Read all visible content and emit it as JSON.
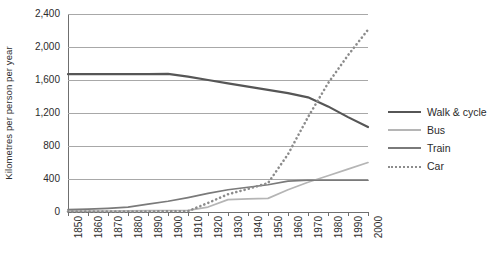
{
  "chart_data": {
    "type": "line",
    "title": "",
    "xlabel": "",
    "ylabel": "Kilometres  per person per year",
    "x": [
      1850,
      1860,
      1870,
      1880,
      1890,
      1900,
      1910,
      1920,
      1930,
      1940,
      1950,
      1960,
      1970,
      1980,
      1990,
      2000
    ],
    "xtick_labels": [
      "1850",
      "1860",
      "1870",
      "1880",
      "1890",
      "1900",
      "1910",
      "1920",
      "1930",
      "1940",
      "1950",
      "1960",
      "1970",
      "1980",
      "1990",
      "2000"
    ],
    "ytick_labels": [
      "0",
      "400",
      "800",
      "1,200",
      "1,600",
      "2,000",
      "2,400"
    ],
    "ytick_values": [
      0,
      400,
      800,
      1200,
      1600,
      2000,
      2400
    ],
    "ylim": [
      0,
      2400
    ],
    "xlim": [
      1850,
      2000
    ],
    "grid": "horizontal",
    "legend_position": "right",
    "series": [
      {
        "name": "Walk & cycle",
        "color": "#565656",
        "style": "solid",
        "values": [
          1670,
          1670,
          1670,
          1670,
          1672,
          1675,
          1640,
          1600,
          1560,
          1520,
          1480,
          1440,
          1390,
          1280,
          1150,
          1030
        ]
      },
      {
        "name": "Bus",
        "color": "#b5b5b5",
        "style": "solid",
        "values": [
          10,
          10,
          12,
          14,
          16,
          18,
          20,
          60,
          150,
          160,
          165,
          270,
          360,
          440,
          520,
          600
        ]
      },
      {
        "name": "Train",
        "color": "#7a7a7a",
        "style": "solid",
        "values": [
          30,
          35,
          45,
          60,
          95,
          130,
          175,
          225,
          270,
          300,
          330,
          375,
          385,
          385,
          385,
          385
        ]
      },
      {
        "name": "Car",
        "color": "#8c8c8c",
        "style": "dotted",
        "values": [
          5,
          5,
          5,
          5,
          6,
          8,
          10,
          110,
          215,
          280,
          350,
          700,
          1150,
          1560,
          1900,
          2210
        ]
      }
    ]
  },
  "legend": {
    "items": [
      {
        "label": "Walk & cycle"
      },
      {
        "label": "Bus"
      },
      {
        "label": "Train"
      },
      {
        "label": "Car"
      }
    ]
  }
}
